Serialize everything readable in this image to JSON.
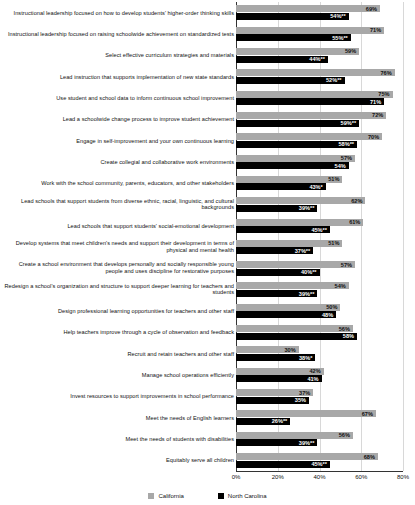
{
  "chart_data": {
    "type": "bar",
    "orientation": "horizontal",
    "title": "",
    "xlabel": "",
    "ylabel": "",
    "xlim": [
      0,
      80
    ],
    "xticks": [
      "0%",
      "20%",
      "40%",
      "60%",
      "80%"
    ],
    "xtick_values": [
      0,
      20,
      40,
      60,
      80
    ],
    "grid": true,
    "legend_position": "bottom-center",
    "series": [
      {
        "name": "California",
        "color": "#a8a8a8",
        "values": [
          69,
          71,
          59,
          76,
          75,
          72,
          70,
          57,
          51,
          62,
          61,
          51,
          57,
          54,
          50,
          56,
          30,
          42,
          37,
          67,
          56,
          68
        ]
      },
      {
        "name": "North Carolina",
        "color": "#000000",
        "values": [
          54,
          55,
          44,
          52,
          71,
          59,
          58,
          54,
          43,
          39,
          45,
          37,
          40,
          39,
          48,
          58,
          38,
          41,
          35,
          26,
          39,
          45
        ]
      }
    ],
    "categories": [
      "Instructional leadership focused on how to develop students' higher-order thinking skills",
      "Instructional leadership focused on raising schoolwide achievement on standardized tests",
      "Select effective curriculum strategies and materials",
      "Lead instruction that supports implementation of new state standards",
      "Use student and school data to inform continuous school improvement",
      "Lead a schoolwide change process to improve student achievement",
      "Engage in self-improvement and your own continuous learning",
      "Create collegial and collaborative work environments",
      "Work with the school community, parents, educators, and other stakeholders",
      "Lead schools that support students from diverse ethnic, racial, linguistic, and cultural backgrounds",
      "Lead schools that support students' social-emotional development",
      "Develop systems that meet children's needs and support their development in terms of physical and mental health",
      "Create a school environment that develops personally and socially responsible young people and uses discipline for restorative purposes",
      "Redesign a school's organization and structure to support deeper learning for teachers and students",
      "Design professional learning opportunities for teachers and other staff",
      "Help teachers improve through a cycle of observation and feedback",
      "Recruit and retain teachers and other staff",
      "Manage school operations efficiently",
      "Invest resources to support improvements in school performance",
      "Meet the needs of English learners",
      "Meet the needs of students with disabilities",
      "Equitably serve all children"
    ],
    "data_labels": {
      "california": [
        "69%",
        "71%",
        "59%",
        "76%",
        "75%",
        "72%",
        "70%",
        "57%",
        "51%",
        "62%",
        "61%",
        "51%",
        "57%",
        "54%",
        "50%",
        "56%",
        "30%",
        "42%",
        "37%",
        "67%",
        "56%",
        "68%"
      ],
      "north_carolina": [
        "54%**",
        "55%**",
        "44%**",
        "52%**",
        "71%",
        "59%**",
        "58%**",
        "54%",
        "43%*",
        "39%**",
        "45%**",
        "37%**",
        "40%**",
        "39%**",
        "48%",
        "58%",
        "38%*",
        "41%",
        "35%",
        "26%**",
        "39%**",
        "45%**"
      ]
    }
  },
  "legend": {
    "items": [
      {
        "label": "California",
        "color": "#a8a8a8"
      },
      {
        "label": "North Carolina",
        "color": "#000000"
      }
    ]
  }
}
